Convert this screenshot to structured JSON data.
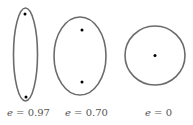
{
  "figure": {
    "stroke_color": "#6b6b6b",
    "focus_color": "#000000",
    "label_color": "#555555",
    "shapes": [
      {
        "kind": "ellipse",
        "eccentricity_var": "e",
        "eccentricity_value": "0.97",
        "label_eq": " = 0.97",
        "center": [
          25.5,
          54.5
        ],
        "rx": 12,
        "ry": 46.5,
        "foci": [
          [
            25,
            14
          ],
          [
            26,
            97
          ]
        ]
      },
      {
        "kind": "ellipse",
        "eccentricity_var": "e",
        "eccentricity_value": "0.70",
        "label_eq": " = 0.70",
        "center": [
          80,
          56
        ],
        "rx": 26,
        "ry": 39,
        "foci": [
          [
            82,
            30
          ],
          [
            82,
            82
          ]
        ]
      },
      {
        "kind": "circle",
        "eccentricity_var": "e",
        "eccentricity_value": "0",
        "label_eq": " = 0",
        "center": [
          155,
          55.5
        ],
        "rx": 30,
        "ry": 29.5,
        "foci": [
          [
            155,
            55
          ]
        ]
      }
    ]
  }
}
